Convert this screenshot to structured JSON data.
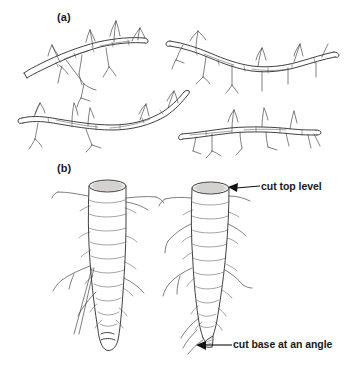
{
  "figure": {
    "background_color": "#ffffff",
    "ink_color": "#2b2b2b",
    "panels": [
      {
        "id": "a",
        "label": "(a)",
        "description": "Four hardwood twig cuttings with lateral side shoots"
      },
      {
        "id": "b",
        "label": "(b)",
        "description": "Two tapering root cuttings, the right one annotated with cut positions"
      }
    ],
    "callouts": [
      {
        "id": "cut-top-level",
        "label": "cut top level",
        "target": "flat cut surface at top of root cutting"
      },
      {
        "id": "cut-base-at-an-angle",
        "label": "cut base at an angle",
        "target": "sloping cut surface at base of root cutting"
      }
    ]
  }
}
